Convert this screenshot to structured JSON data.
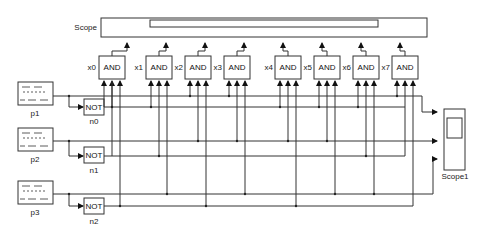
{
  "diagram": {
    "type": "simulink-block-diagram",
    "background": "#ffffff",
    "line_color": "#333333",
    "scope_top": {
      "label": "Scope"
    },
    "scope_right": {
      "label": "Scope1"
    },
    "pulse_generators": [
      {
        "id": "p1",
        "label": "p1"
      },
      {
        "id": "p2",
        "label": "p2"
      },
      {
        "id": "p3",
        "label": "p3"
      }
    ],
    "not_gates": [
      {
        "id": "n0",
        "label": "n0",
        "text": "NOT"
      },
      {
        "id": "n1",
        "label": "n1",
        "text": "NOT"
      },
      {
        "id": "n2",
        "label": "n2",
        "text": "NOT"
      }
    ],
    "and_gates": [
      {
        "id": "x0",
        "label": "x0",
        "text": "AND"
      },
      {
        "id": "x1",
        "label": "x1",
        "text": "AND"
      },
      {
        "id": "x2",
        "label": "x2",
        "text": "AND"
      },
      {
        "id": "x3",
        "label": "x3",
        "text": "AND"
      },
      {
        "id": "x4",
        "label": "x4",
        "text": "AND"
      },
      {
        "id": "x5",
        "label": "x5",
        "text": "AND"
      },
      {
        "id": "x6",
        "label": "x6",
        "text": "AND"
      },
      {
        "id": "x7",
        "label": "x7",
        "text": "AND"
      }
    ]
  }
}
